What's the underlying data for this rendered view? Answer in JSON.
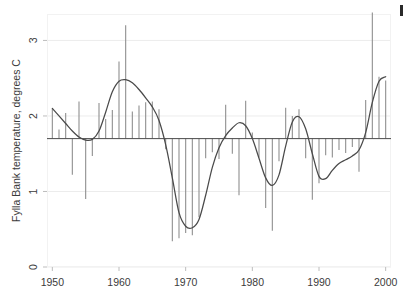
{
  "chart_data": {
    "type": "bar",
    "title": "",
    "subtitle": "",
    "xlabel": "",
    "ylabel": "Fylla Bank temperature, degrees C",
    "xlim": [
      1949.2,
      2000.8
    ],
    "ylim": [
      0,
      3.35
    ],
    "xticks": [
      1950,
      1960,
      1970,
      1980,
      1990,
      2000
    ],
    "xticklabels": [
      "1950",
      "1960",
      "1970",
      "1980",
      "1990",
      "2000"
    ],
    "yticks": [
      0,
      1,
      2,
      3
    ],
    "yticklabels": [
      "0",
      "1",
      "2",
      "3"
    ],
    "grid": true,
    "grid_axis": "y",
    "legend": false,
    "baseline": 1.7,
    "bar_color": "#8f8f8f",
    "line_color": "#4a4a4a",
    "grid_color": "#ececec",
    "frame_color": "#f2f2f2",
    "background_color": "#ffffff",
    "series": [
      {
        "name": "Annual mean temperature",
        "type": "bar",
        "note": "Vertical spikes drawn from the baseline value 1.7 to the annual value",
        "x": [
          1950,
          1951,
          1952,
          1953,
          1954,
          1955,
          1956,
          1957,
          1958,
          1959,
          1960,
          1961,
          1962,
          1963,
          1964,
          1965,
          1966,
          1967,
          1968,
          1969,
          1970,
          1971,
          1972,
          1973,
          1974,
          1975,
          1976,
          1977,
          1978,
          1979,
          1980,
          1981,
          1982,
          1983,
          1984,
          1985,
          1986,
          1987,
          1988,
          1989,
          1990,
          1991,
          1992,
          1993,
          1994,
          1995,
          1996,
          1997,
          1998,
          1999,
          2000
        ],
        "values": [
          2.1,
          1.82,
          2.04,
          1.22,
          2.19,
          0.9,
          1.47,
          2.17,
          1.96,
          2.08,
          2.72,
          3.2,
          2.06,
          2.14,
          2.18,
          2.19,
          2.09,
          1.56,
          0.34,
          0.38,
          0.45,
          0.42,
          0.66,
          1.44,
          1.52,
          1.43,
          2.15,
          1.5,
          0.95,
          2.2,
          1.78,
          1.45,
          0.78,
          0.48,
          1.4,
          2.11,
          2.0,
          2.09,
          1.44,
          0.89,
          1.11,
          1.48,
          1.45,
          1.55,
          1.51,
          1.59,
          1.26,
          2.21,
          3.37,
          2.52,
          2.47
        ]
      },
      {
        "name": "Smoothed trend",
        "type": "line",
        "x": [
          1950,
          1951,
          1952,
          1953,
          1954,
          1955,
          1956,
          1957,
          1958,
          1959,
          1960,
          1961,
          1962,
          1963,
          1964,
          1965,
          1966,
          1967,
          1968,
          1969,
          1970,
          1971,
          1972,
          1973,
          1974,
          1975,
          1976,
          1977,
          1978,
          1979,
          1980,
          1981,
          1982,
          1983,
          1984,
          1985,
          1986,
          1987,
          1988,
          1989,
          1990,
          1991,
          1992,
          1993,
          1994,
          1995,
          1996,
          1997,
          1998,
          1999,
          2000
        ],
        "values": [
          2.1,
          2.0,
          1.9,
          1.8,
          1.72,
          1.68,
          1.69,
          1.8,
          2.05,
          2.32,
          2.46,
          2.48,
          2.44,
          2.35,
          2.24,
          2.12,
          1.94,
          1.62,
          1.18,
          0.72,
          0.54,
          0.52,
          0.63,
          0.95,
          1.32,
          1.58,
          1.74,
          1.84,
          1.91,
          1.87,
          1.7,
          1.44,
          1.18,
          1.08,
          1.22,
          1.6,
          1.92,
          1.99,
          1.83,
          1.5,
          1.2,
          1.17,
          1.28,
          1.37,
          1.42,
          1.47,
          1.55,
          1.78,
          2.18,
          2.46,
          2.52
        ]
      }
    ]
  },
  "marks": {
    "corner_mark": "edge-artifact"
  }
}
